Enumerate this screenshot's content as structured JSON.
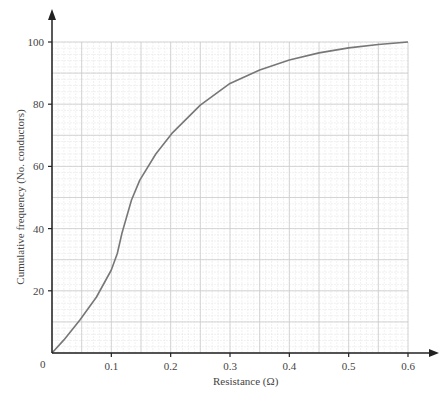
{
  "chart_data": {
    "type": "line",
    "title": "",
    "xlabel": "Resistance (Ω)",
    "ylabel": "Cumulative frequency (No. conductors)",
    "xlim": [
      0,
      0.6
    ],
    "ylim": [
      0,
      100
    ],
    "x_ticks": [
      "0.1",
      "0.2",
      "0.3",
      "0.4",
      "0.5",
      "0.6"
    ],
    "y_ticks": [
      "20",
      "40",
      "60",
      "80",
      "100"
    ],
    "origin_label": "0",
    "grid": true,
    "grid_major": {
      "x": 0.05,
      "y": 10
    },
    "grid_minor": {
      "x": 0.01,
      "y": 2
    },
    "legend": null,
    "series": [
      {
        "name": "Cumulative frequency",
        "color": "#777777",
        "x": [
          0,
          0.02,
          0.047,
          0.075,
          0.1,
          0.11,
          0.118,
          0.134,
          0.148,
          0.175,
          0.202,
          0.25,
          0.3,
          0.35,
          0.4,
          0.45,
          0.5,
          0.55,
          0.6
        ],
        "y": [
          0,
          4.2,
          10.6,
          18,
          26.7,
          32,
          38.6,
          49.2,
          55.6,
          64,
          70.6,
          79.7,
          86.7,
          91,
          94.2,
          96.5,
          98.1,
          99.2,
          100
        ]
      }
    ]
  },
  "colors": {
    "axis": "#222222",
    "grid_major": "#cccccc",
    "grid_minor": "#e8e8e8",
    "curve": "#777777"
  }
}
